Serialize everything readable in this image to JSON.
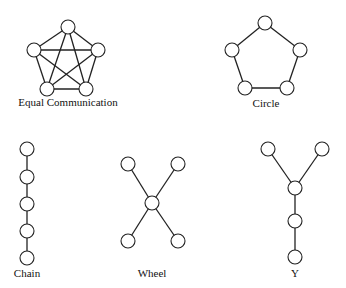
{
  "networks": [
    {
      "id": "equal",
      "label": "Equal Communication",
      "label_pos": [
        68,
        106
      ],
      "nodes": [
        [
          68,
          27
        ],
        [
          34,
          50
        ],
        [
          98,
          50
        ],
        [
          47,
          89
        ],
        [
          86,
          89
        ]
      ],
      "edges": [
        [
          0,
          1
        ],
        [
          0,
          2
        ],
        [
          0,
          3
        ],
        [
          0,
          4
        ],
        [
          1,
          2
        ],
        [
          1,
          3
        ],
        [
          1,
          4
        ],
        [
          2,
          3
        ],
        [
          2,
          4
        ],
        [
          3,
          4
        ]
      ]
    },
    {
      "id": "circle",
      "label": "Circle",
      "label_pos": [
        266,
        107
      ],
      "nodes": [
        [
          265,
          23
        ],
        [
          232,
          50
        ],
        [
          300,
          50
        ],
        [
          245,
          88
        ],
        [
          287,
          88
        ]
      ],
      "edges": [
        [
          0,
          1
        ],
        [
          0,
          2
        ],
        [
          1,
          3
        ],
        [
          2,
          4
        ],
        [
          3,
          4
        ]
      ]
    },
    {
      "id": "chain",
      "label": "Chain",
      "label_pos": [
        27,
        277
      ],
      "nodes": [
        [
          27,
          149
        ],
        [
          27,
          177
        ],
        [
          27,
          204
        ],
        [
          27,
          231
        ],
        [
          27,
          258
        ]
      ],
      "edges": [
        [
          0,
          1
        ],
        [
          1,
          2
        ],
        [
          2,
          3
        ],
        [
          3,
          4
        ]
      ]
    },
    {
      "id": "wheel",
      "label": "Wheel",
      "label_pos": [
        152,
        277
      ],
      "nodes": [
        [
          152,
          203
        ],
        [
          128,
          164
        ],
        [
          178,
          164
        ],
        [
          128,
          241
        ],
        [
          178,
          241
        ]
      ],
      "edges": [
        [
          0,
          1
        ],
        [
          0,
          2
        ],
        [
          0,
          3
        ],
        [
          0,
          4
        ]
      ]
    },
    {
      "id": "y",
      "label": "Y",
      "label_pos": [
        295,
        277
      ],
      "nodes": [
        [
          268,
          149
        ],
        [
          322,
          149
        ],
        [
          295,
          188
        ],
        [
          295,
          221
        ],
        [
          295,
          257
        ]
      ],
      "edges": [
        [
          0,
          2
        ],
        [
          1,
          2
        ],
        [
          2,
          3
        ],
        [
          3,
          4
        ]
      ]
    }
  ],
  "node_radius": 7
}
